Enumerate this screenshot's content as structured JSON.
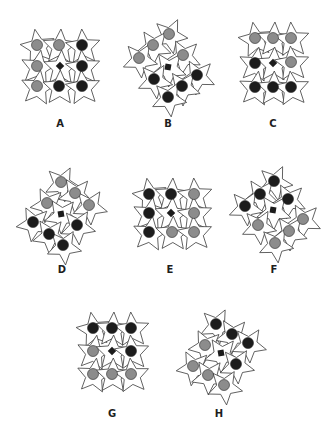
{
  "colors": {
    "gray": "#8c8c8c",
    "black": "#1c1c1c",
    "star_stroke": "#3a3a3a",
    "center": "#1c1c1c"
  },
  "figures": [
    {
      "label": "A",
      "label_pos": [
        60,
        127
      ],
      "rotate": 0,
      "cells": [
        {
          "x": 37,
          "y": 45,
          "t": "gray"
        },
        {
          "x": 59,
          "y": 45,
          "t": "gray"
        },
        {
          "x": 82,
          "y": 45,
          "t": "black"
        },
        {
          "x": 37,
          "y": 66,
          "t": "gray"
        },
        {
          "x": 60,
          "y": 66,
          "t": "square"
        },
        {
          "x": 82,
          "y": 66,
          "t": "black"
        },
        {
          "x": 37,
          "y": 86,
          "t": "gray"
        },
        {
          "x": 59,
          "y": 86,
          "t": "black"
        },
        {
          "x": 82,
          "y": 86,
          "t": "black"
        }
      ]
    },
    {
      "label": "B",
      "label_pos": [
        168,
        127
      ],
      "rotate": 35,
      "cells": [
        {
          "x": 169,
          "y": 34,
          "t": "gray"
        },
        {
          "x": 153,
          "y": 45,
          "t": "gray"
        },
        {
          "x": 139,
          "y": 58,
          "t": "gray"
        },
        {
          "x": 183,
          "y": 55,
          "t": "gray"
        },
        {
          "x": 168,
          "y": 67,
          "t": "square"
        },
        {
          "x": 154,
          "y": 79,
          "t": "black"
        },
        {
          "x": 197,
          "y": 75,
          "t": "black"
        },
        {
          "x": 182,
          "y": 86,
          "t": "black"
        },
        {
          "x": 168,
          "y": 97,
          "t": "black"
        }
      ]
    },
    {
      "label": "C",
      "label_pos": [
        273,
        127
      ],
      "rotate": 0,
      "cells": [
        {
          "x": 255,
          "y": 38,
          "t": "gray"
        },
        {
          "x": 273,
          "y": 38,
          "t": "gray"
        },
        {
          "x": 291,
          "y": 38,
          "t": "gray"
        },
        {
          "x": 255,
          "y": 63,
          "t": "black"
        },
        {
          "x": 273,
          "y": 63,
          "t": "square"
        },
        {
          "x": 291,
          "y": 62,
          "t": "gray"
        },
        {
          "x": 255,
          "y": 87,
          "t": "black"
        },
        {
          "x": 273,
          "y": 87,
          "t": "black"
        },
        {
          "x": 291,
          "y": 87,
          "t": "black"
        }
      ]
    },
    {
      "label": "D",
      "label_pos": [
        62,
        273
      ],
      "rotate": -35,
      "cells": [
        {
          "x": 61,
          "y": 182,
          "t": "gray"
        },
        {
          "x": 75,
          "y": 193,
          "t": "gray"
        },
        {
          "x": 89,
          "y": 205,
          "t": "gray"
        },
        {
          "x": 47,
          "y": 203,
          "t": "gray"
        },
        {
          "x": 61,
          "y": 214,
          "t": "square"
        },
        {
          "x": 77,
          "y": 225,
          "t": "black"
        },
        {
          "x": 33,
          "y": 222,
          "t": "black"
        },
        {
          "x": 49,
          "y": 234,
          "t": "black"
        },
        {
          "x": 63,
          "y": 245,
          "t": "black"
        }
      ]
    },
    {
      "label": "E",
      "label_pos": [
        170,
        273
      ],
      "rotate": 0,
      "cells": [
        {
          "x": 149,
          "y": 194,
          "t": "black"
        },
        {
          "x": 171,
          "y": 194,
          "t": "black"
        },
        {
          "x": 194,
          "y": 194,
          "t": "gray"
        },
        {
          "x": 149,
          "y": 213,
          "t": "black"
        },
        {
          "x": 171,
          "y": 213,
          "t": "square"
        },
        {
          "x": 194,
          "y": 213,
          "t": "gray"
        },
        {
          "x": 149,
          "y": 232,
          "t": "black"
        },
        {
          "x": 172,
          "y": 232,
          "t": "gray"
        },
        {
          "x": 194,
          "y": 232,
          "t": "gray"
        }
      ]
    },
    {
      "label": "F",
      "label_pos": [
        274,
        273
      ],
      "rotate": 35,
      "cells": [
        {
          "x": 274,
          "y": 181,
          "t": "black"
        },
        {
          "x": 260,
          "y": 194,
          "t": "black"
        },
        {
          "x": 245,
          "y": 206,
          "t": "black"
        },
        {
          "x": 288,
          "y": 199,
          "t": "black"
        },
        {
          "x": 273,
          "y": 210,
          "t": "square"
        },
        {
          "x": 258,
          "y": 225,
          "t": "gray"
        },
        {
          "x": 303,
          "y": 219,
          "t": "gray"
        },
        {
          "x": 289,
          "y": 231,
          "t": "gray"
        },
        {
          "x": 275,
          "y": 243,
          "t": "gray"
        }
      ]
    },
    {
      "label": "G",
      "label_pos": [
        112,
        417
      ],
      "rotate": 0,
      "cells": [
        {
          "x": 93,
          "y": 328,
          "t": "black"
        },
        {
          "x": 112,
          "y": 328,
          "t": "black"
        },
        {
          "x": 131,
          "y": 328,
          "t": "black"
        },
        {
          "x": 93,
          "y": 351,
          "t": "gray"
        },
        {
          "x": 112,
          "y": 351,
          "t": "square"
        },
        {
          "x": 131,
          "y": 351,
          "t": "black"
        },
        {
          "x": 93,
          "y": 374,
          "t": "gray"
        },
        {
          "x": 112,
          "y": 374,
          "t": "gray"
        },
        {
          "x": 131,
          "y": 374,
          "t": "gray"
        }
      ]
    },
    {
      "label": "H",
      "label_pos": [
        219,
        417
      ],
      "rotate": -35,
      "cells": [
        {
          "x": 216,
          "y": 324,
          "t": "black"
        },
        {
          "x": 232,
          "y": 334,
          "t": "black"
        },
        {
          "x": 248,
          "y": 343,
          "t": "black"
        },
        {
          "x": 205,
          "y": 345,
          "t": "gray"
        },
        {
          "x": 221,
          "y": 353,
          "t": "square"
        },
        {
          "x": 236,
          "y": 364,
          "t": "black"
        },
        {
          "x": 193,
          "y": 366,
          "t": "gray"
        },
        {
          "x": 208,
          "y": 375,
          "t": "gray"
        },
        {
          "x": 224,
          "y": 385,
          "t": "gray"
        }
      ]
    }
  ]
}
